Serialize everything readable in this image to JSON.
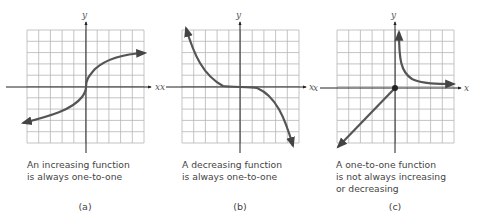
{
  "figure": {
    "panels": [
      {
        "id": "a",
        "panel_label": "(a)",
        "caption": "An increasing function\nis always one-to-one",
        "x_axis_label": "x",
        "y_axis_label": "y",
        "curve_description": "increasing S-shaped curve through origin, arrows on both ends"
      },
      {
        "id": "b",
        "panel_label": "(b)",
        "caption": "A decreasing function\nis always one-to-one",
        "x_axis_label": "x",
        "y_axis_label": "y",
        "curve_description": "decreasing cubic-like curve, flat near origin, arrows on both ends"
      },
      {
        "id": "c",
        "panel_label": "(c)",
        "caption": "A one-to-one function\nis not always increasing\nor decreasing",
        "x_axis_label": "x",
        "y_axis_label": "y",
        "curve_description": "line rising to a closed dot at origin, plus a decreasing hyperbola branch in quadrant I",
        "endpoint": "closed dot at origin"
      }
    ],
    "grid": {
      "columns": 10,
      "rows": 10
    },
    "colors": {
      "curve": "#555555",
      "grid": "#b5b5b5",
      "axis": "#222222"
    }
  }
}
